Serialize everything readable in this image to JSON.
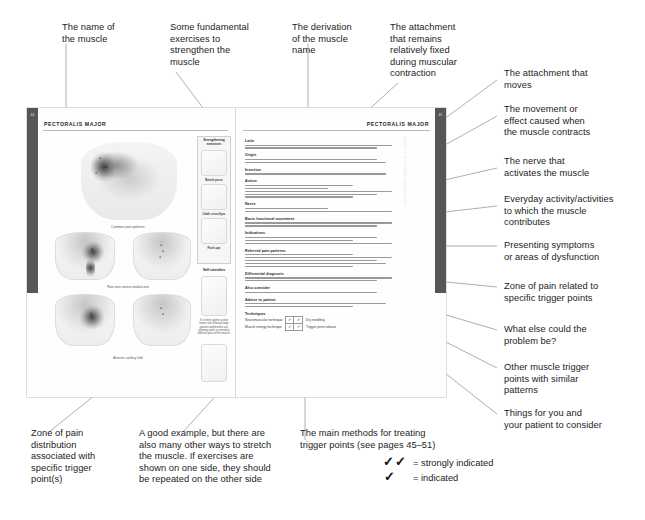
{
  "figure": {
    "type": "annotated-book-spread",
    "subject": "PECTORALIS MAJOR"
  },
  "callouts": {
    "top": [
      {
        "id": "muscle-name",
        "text": "The name of\nthe muscle"
      },
      {
        "id": "strengthening",
        "text": "Some fundamental\nexercises to\nstrengthen the\nmuscle"
      },
      {
        "id": "derivation",
        "text": "The derivation\nof the muscle\nname"
      },
      {
        "id": "origin",
        "text": "The attachment\nthat remains\nrelatively fixed\nduring muscular\ncontraction"
      }
    ],
    "right": [
      {
        "id": "insertion",
        "text": "The attachment that\nmoves"
      },
      {
        "id": "action",
        "text": "The movement or\neffect caused when\nthe muscle contracts"
      },
      {
        "id": "nerve",
        "text": "The nerve that\nactivates the muscle"
      },
      {
        "id": "basic-movement",
        "text": "Everyday activity/activities\nto which the muscle\ncontributes"
      },
      {
        "id": "indications",
        "text": "Presenting symptoms\nor areas of dysfunction"
      },
      {
        "id": "referred-pain",
        "text": "Zone of pain related to\nspecific trigger points"
      },
      {
        "id": "differential",
        "text": "What else could the\nproblem be?"
      },
      {
        "id": "also-consider",
        "text": "Other muscle trigger\npoints with similar\npatterns"
      },
      {
        "id": "advice",
        "text": "Things for you and\nyour patient to consider"
      }
    ],
    "bottom": [
      {
        "id": "pain-zone",
        "text": "Zone of pain\ndistribution\nassociated with\nspecific trigger\npoint(s)"
      },
      {
        "id": "self-stretch",
        "text": "A good example, but there are\nalso many other ways to stretch\nthe muscle. If exercises are\nshown on one side, they should\nbe repeated on the other side"
      },
      {
        "id": "techniques",
        "text": "The main methods for treating\ntrigger points (see pages 45–51)"
      }
    ]
  },
  "legend": {
    "rows": [
      {
        "ticks": "✓✓",
        "label": "= strongly indicated"
      },
      {
        "ticks": "✓",
        "label": "= indicated"
      }
    ]
  },
  "spread": {
    "left_page": {
      "title": "PECTORALIS MAJOR",
      "tab_number": "44",
      "tab_text": "Muscles of the shoulder and upper arm",
      "captions": {
        "main_figure": "",
        "referred_1": "Common pain patterns",
        "referred_2": "Pain over antero-medial arm",
        "referred_3": "Anterior axillary fold"
      },
      "exercise_box": {
        "heading": "Strengthening\nexercises",
        "items": [
          {
            "caption": "Bench press"
          },
          {
            "caption": "Cable crossflyes"
          },
          {
            "caption": "Push-ups"
          }
        ]
      },
      "self_stretch": {
        "heading": "Self stretches",
        "note": "To stretch against a door frame, take forward lunge position and breathe out, allowing arm/s to extend at different parts of the muscle."
      }
    },
    "right_page": {
      "title": "PECTORALIS MAJOR",
      "tab_number": "45",
      "tab_text": "Muscles of the shoulder and upper arm",
      "sections": [
        {
          "heading": "Latin",
          "lines": 2
        },
        {
          "heading": "Origin",
          "lines": 2
        },
        {
          "heading": "Insertion",
          "lines": 1
        },
        {
          "heading": "Action",
          "lines": 5
        },
        {
          "heading": "Nerve",
          "lines": 2
        },
        {
          "heading": "Basic functional movement",
          "lines": 2
        },
        {
          "heading": "Indications",
          "lines": 3
        },
        {
          "heading": "Referred pain patterns",
          "lines": 5
        },
        {
          "heading": "Differential diagnosis",
          "lines": 2
        },
        {
          "heading": "Also consider",
          "lines": 1
        },
        {
          "heading": "Advice to patient",
          "lines": 2
        },
        {
          "heading": "Techniques",
          "lines": 0
        }
      ],
      "techniques_table": {
        "rows": [
          {
            "label": "Neuromuscular technique",
            "cells": [
              "✓",
              "✓"
            ],
            "note": "Dry needling"
          },
          {
            "label": "Muscle energy technique",
            "cells": [
              "✓",
              "✓"
            ],
            "note": "Trigger point release"
          }
        ]
      }
    }
  },
  "colors": {
    "ink": "#211d1e",
    "leader_line": "#9a9a9a",
    "tab_dark": "#565656",
    "page": "#fefefe",
    "rule": "#b9b9b9"
  }
}
